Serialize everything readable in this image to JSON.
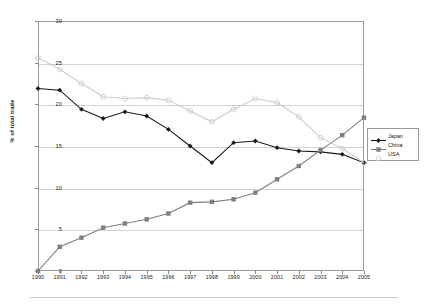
{
  "chart_data": {
    "type": "line",
    "title": "",
    "subtitle": "",
    "xlabel": "",
    "ylabel": "% of total trade",
    "categories": [
      "1990",
      "1991",
      "1992",
      "1993",
      "1994",
      "1995",
      "1996",
      "1997",
      "1998",
      "1999",
      "2000",
      "2001",
      "2002",
      "2003",
      "2004",
      "2005"
    ],
    "x": [
      1990,
      1991,
      1992,
      1993,
      1994,
      1995,
      1996,
      1997,
      1998,
      1999,
      2000,
      2001,
      2002,
      2003,
      2004,
      2005
    ],
    "xlim": [
      1990,
      2005
    ],
    "ylim": [
      0,
      30
    ],
    "yticks": [
      0,
      5,
      10,
      15,
      20,
      25,
      30
    ],
    "grid": true,
    "legend_position": "right",
    "series": [
      {
        "name": "Japan",
        "color": "#1a1a1a",
        "marker": "diamond",
        "values": [
          21.9,
          21.7,
          19.4,
          18.3,
          19.1,
          18.6,
          17.0,
          15.0,
          13.0,
          15.4,
          15.6,
          14.8,
          14.4,
          14.3,
          14.0,
          13.0
        ]
      },
      {
        "name": "China",
        "color": "#7f7f7f",
        "marker": "square",
        "values": [
          0.0,
          2.9,
          4.0,
          5.2,
          5.7,
          6.2,
          6.9,
          8.2,
          8.3,
          8.6,
          9.4,
          11.0,
          12.6,
          14.5,
          16.3,
          18.4
        ]
      },
      {
        "name": "USA",
        "color": "#cccccc",
        "marker": "star",
        "values": [
          25.6,
          24.2,
          22.5,
          20.9,
          20.7,
          20.8,
          20.5,
          19.2,
          17.9,
          19.4,
          20.7,
          20.2,
          18.5,
          16.0,
          14.7,
          13.0
        ]
      }
    ]
  }
}
